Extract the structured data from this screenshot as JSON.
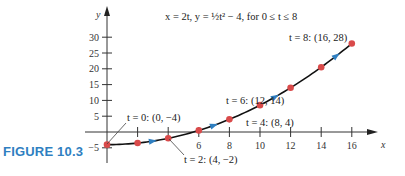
{
  "caption": "FIGURE 10.3",
  "equation": "x = 2t, y = ½t² − 4, for 0 ≤ t ≤ 8",
  "axes": {
    "x_label": "x",
    "y_label": "y",
    "x_ticks": [
      "2",
      "4",
      "6",
      "8",
      "10",
      "12",
      "14",
      "16"
    ],
    "y_ticks": [
      "30",
      "25",
      "20",
      "15",
      "10",
      "5",
      "−5"
    ]
  },
  "annotations": {
    "t0": "t = 0: (0, −4)",
    "t2": "t = 2: (4, −2)",
    "t4": "t = 4: (8, 4)",
    "t6": "t = 6: (12, 14)",
    "t8": "t = 8: (16, 28)"
  },
  "colors": {
    "curve": "#111111",
    "points": "#d94a4a",
    "arrows": "#2f7fc1",
    "caption": "#2f7fc1"
  },
  "chart_data": {
    "type": "line",
    "xlabel": "x",
    "ylabel": "y",
    "xlim": [
      0,
      17
    ],
    "ylim": [
      -6,
      32
    ],
    "x_ticks": [
      2,
      4,
      6,
      8,
      10,
      12,
      14,
      16
    ],
    "y_ticks": [
      -5,
      5,
      10,
      15,
      20,
      25,
      30
    ],
    "grid": false,
    "series": [
      {
        "name": "parametric curve",
        "t": [
          0,
          1,
          2,
          3,
          4,
          5,
          6,
          7,
          8
        ],
        "x": [
          0,
          2,
          4,
          6,
          8,
          10,
          12,
          14,
          16
        ],
        "y": [
          -4,
          -3.5,
          -2,
          0.5,
          4,
          8.5,
          14,
          20.5,
          28
        ]
      }
    ],
    "labeled_points": [
      {
        "t": 0,
        "x": 0,
        "y": -4,
        "label": "t = 0: (0, −4)"
      },
      {
        "t": 2,
        "x": 4,
        "y": -2,
        "label": "t = 2: (4, −2)"
      },
      {
        "t": 4,
        "x": 8,
        "y": 4,
        "label": "t = 4: (8, 4)"
      },
      {
        "t": 6,
        "x": 12,
        "y": 14,
        "label": "t = 6: (12, 14)"
      },
      {
        "t": 8,
        "x": 16,
        "y": 28,
        "label": "t = 8: (16, 28)"
      }
    ],
    "direction_arrows_at_x": [
      3,
      7,
      11,
      15
    ]
  }
}
